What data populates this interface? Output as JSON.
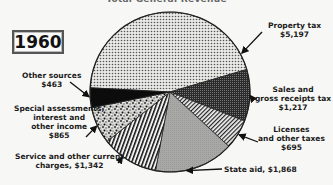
{
  "chart_data": {
    "type": "pie",
    "title": "Total General Revenue",
    "year_label": "1960",
    "units": "$ (millions)",
    "slices": [
      {
        "name": "Property tax",
        "label_lines": [
          "Property tax",
          "$5,197"
        ],
        "value": 5197,
        "pattern": "dots"
      },
      {
        "name": "Sales and gross receipts tax",
        "label_lines": [
          "Sales and",
          "gross receipts tax",
          "$1,217"
        ],
        "value": 1217,
        "pattern": "dense-dark"
      },
      {
        "name": "Licenses and other taxes",
        "label_lines": [
          "Licenses",
          "and other taxes",
          "$695"
        ],
        "value": 695,
        "pattern": "diagonal-hatch"
      },
      {
        "name": "State aid",
        "label_lines": [
          "State aid, $1,868"
        ],
        "value": 1868,
        "pattern": "gray"
      },
      {
        "name": "Service and other current charges",
        "label_lines": [
          "Service and other current",
          "charges, $1,342"
        ],
        "value": 1342,
        "pattern": "vertical-stripes"
      },
      {
        "name": "Special assessments, interest and other income",
        "label_lines": [
          "Special assessments,",
          "interest and",
          "other income",
          "$865"
        ],
        "value": 865,
        "pattern": "speckle"
      },
      {
        "name": "Other sources",
        "label_lines": [
          "Other sources",
          "$463"
        ],
        "value": 463,
        "pattern": "black"
      }
    ]
  }
}
